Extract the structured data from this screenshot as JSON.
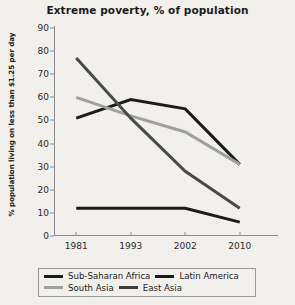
{
  "chart_data": {
    "type": "line",
    "title": "Extreme poverty, % of population",
    "xlabel": "",
    "ylabel": "% population living on less than $1.25 per day",
    "categories": [
      "1981",
      "1993",
      "2002",
      "2010"
    ],
    "ylim": [
      0,
      90
    ],
    "yticks": [
      0,
      10,
      20,
      30,
      40,
      50,
      60,
      70,
      80,
      90
    ],
    "grid": false,
    "legend_position": "bottom",
    "series": [
      {
        "name": "Sub-Saharan Africa",
        "values": [
          51,
          59,
          55,
          31
        ],
        "color": "#1b1b1b"
      },
      {
        "name": "Latin America",
        "values": [
          12,
          12,
          12,
          6
        ],
        "color": "#1b1b1b"
      },
      {
        "name": "South Asia",
        "values": [
          60,
          52,
          45,
          31
        ],
        "color": "#a0a0a0"
      },
      {
        "name": "East Asia",
        "values": [
          77,
          51,
          28,
          12
        ],
        "color": "#4a4a4a"
      }
    ]
  },
  "legend": {
    "rows": [
      [
        {
          "label": "Sub-Saharan Africa",
          "color": "#1b1b1b"
        },
        {
          "label": "Latin America",
          "color": "#1b1b1b"
        }
      ],
      [
        {
          "label": "South Asia",
          "color": "#a0a0a0"
        },
        {
          "label": "East Asia",
          "color": "#3d3d3d"
        }
      ]
    ]
  }
}
